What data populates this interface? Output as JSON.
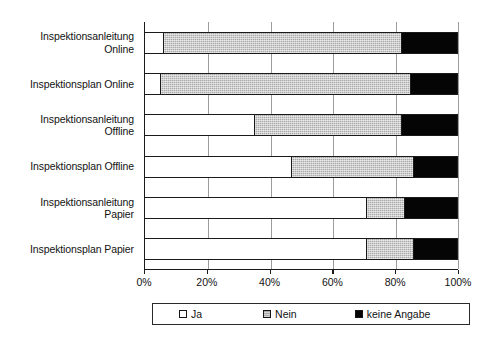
{
  "chart_data": {
    "type": "bar",
    "orientation": "horizontal",
    "stacked": true,
    "stack_mode": "percent",
    "title": "",
    "xlabel": "",
    "ylabel": "",
    "xlim": [
      0,
      100
    ],
    "grid": true,
    "legend_position": "bottom",
    "categories": [
      "Inspektionsanleitung Online",
      "Inspektionsplan Online",
      "Inspektionsanleitung Offline",
      "Inspektionsplan Offline",
      "Inspektionsanleitung Papier",
      "Inspektionsplan Papier"
    ],
    "category_label_lines": [
      [
        "Inspektionsanleitung",
        "Online"
      ],
      [
        "Inspektionsplan Online"
      ],
      [
        "Inspektionsanleitung",
        "Offline"
      ],
      [
        "Inspektionsplan Offline"
      ],
      [
        "Inspektionsanleitung",
        "Papier"
      ],
      [
        "Inspektionsplan Papier"
      ]
    ],
    "series": [
      {
        "name": "Ja",
        "color": "#ffffff",
        "values": [
          6,
          5,
          35,
          47,
          71,
          71
        ]
      },
      {
        "name": "Nein",
        "color": "#a9a9a9",
        "values": [
          76,
          80,
          47,
          39,
          12,
          15
        ]
      },
      {
        "name": "keine Angabe",
        "color": "#050505",
        "values": [
          18,
          15,
          18,
          14,
          17,
          14
        ]
      }
    ],
    "tick_values": [
      0,
      20,
      40,
      60,
      80,
      100
    ],
    "tick_labels": [
      "0%",
      "20%",
      "40%",
      "60%",
      "80%",
      "100%"
    ]
  },
  "legend": {
    "items": [
      {
        "label": "Ja",
        "swatch": "ja"
      },
      {
        "label": "Nein",
        "swatch": "nein"
      },
      {
        "label": "keine Angabe",
        "swatch": "keine"
      }
    ]
  }
}
